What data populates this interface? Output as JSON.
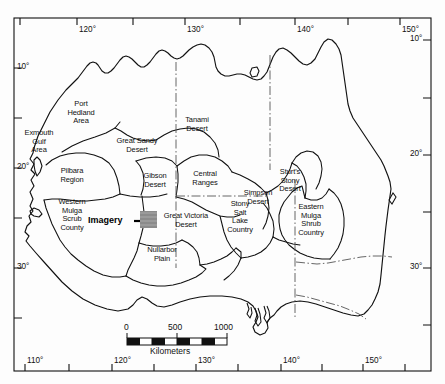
{
  "figure": {
    "type": "map",
    "background_color": "#ffffff",
    "line_color": "#111111",
    "imagery_marker_color": "#8f8f8f"
  },
  "axes": {
    "top_ticks": [
      {
        "label": "120°",
        "x": 77
      },
      {
        "label": "130°",
        "x": 185
      },
      {
        "label": "140°",
        "x": 295
      },
      {
        "label": "150°",
        "x": 400
      }
    ],
    "bottom_ticks": [
      {
        "label": "110°",
        "x": 25
      },
      {
        "label": "120°",
        "x": 112
      },
      {
        "label": "130°",
        "x": 196
      },
      {
        "label": "140°",
        "x": 281
      },
      {
        "label": "150°",
        "x": 363
      }
    ],
    "left_ticks": [
      {
        "label": "10°",
        "y": 68
      },
      {
        "label": "20°",
        "y": 168
      },
      {
        "label": "30°",
        "y": 268
      }
    ],
    "right_ticks": [
      {
        "label": "10°",
        "y": 40
      },
      {
        "label": "20°",
        "y": 155
      },
      {
        "label": "30°",
        "y": 268
      }
    ]
  },
  "regions": [
    {
      "name": "exmouth-gulf-area",
      "label": "Exmouth\nGulf\nArea",
      "x": 39,
      "y": 142
    },
    {
      "name": "port-hedland-area",
      "label": "Port\nHedland\nArea",
      "x": 81,
      "y": 113
    },
    {
      "name": "pilbara-region",
      "label": "Pilbara\nRegion",
      "x": 72,
      "y": 175
    },
    {
      "name": "great-sandy-desert",
      "label": "Great Sandy\nDesert",
      "x": 137,
      "y": 145
    },
    {
      "name": "tanami-desert",
      "label": "Tanami\nDesert",
      "x": 197,
      "y": 124
    },
    {
      "name": "gibson-desert",
      "label": "Gibson\nDesert",
      "x": 155,
      "y": 180
    },
    {
      "name": "central-ranges",
      "label": "Central\nRanges",
      "x": 205,
      "y": 178
    },
    {
      "name": "sturts-stony-desert",
      "label": "Sturt's\nStony\nDesert",
      "x": 290,
      "y": 180
    },
    {
      "name": "simpson-desert",
      "label": "Simpson\nDesert",
      "x": 258,
      "y": 197
    },
    {
      "name": "western-mulga-scrub-county",
      "label": "Western\nMulga\nScrub\nCounty",
      "x": 72,
      "y": 214
    },
    {
      "name": "great-victoria-desert",
      "label": "Great Victoria\nDesert",
      "x": 186,
      "y": 220
    },
    {
      "name": "stony-salt-lake-country",
      "label": "Stony\nSalt\nLake\nCountry",
      "x": 240,
      "y": 216
    },
    {
      "name": "eastern-mulga-shrub-country",
      "label": "Eastern\nMulga\nShrub\nCountry",
      "x": 311,
      "y": 219
    },
    {
      "name": "nullarbor-plain",
      "label": "Nullarbor\nPlain",
      "x": 162,
      "y": 253
    }
  ],
  "imagery_marker": {
    "label": "Imagery",
    "label_x": 103,
    "label_y": 219,
    "leader_x1": 134,
    "leader_x2": 146,
    "leader_y": 222,
    "box_x": 140,
    "box_y": 211,
    "box_w": 17,
    "box_h": 17
  },
  "scale_bar": {
    "unit_label": "Kilometers",
    "ticks": [
      "0",
      "500",
      "1000"
    ],
    "tick_x": [
      127,
      177,
      226
    ],
    "bar_x": 127,
    "bar_y": 338,
    "bar_w": 100,
    "bar_h": 7,
    "segments": 8,
    "label_y": 324,
    "unit_y": 347,
    "unit_x": 177
  }
}
